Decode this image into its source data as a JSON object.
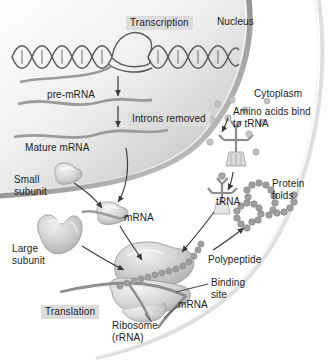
{
  "diagram": {
    "type": "biology-process-diagram",
    "background_color": "#ffffff",
    "ink_color": "#1c1c1c",
    "structure_fill": "#c9c9c9",
    "label_box_color": "#dcdcdc"
  },
  "labels": {
    "transcription": "Transcription",
    "nucleus": "Nucleus",
    "pre_mrna": "pre-mRNA",
    "introns_removed": "Introns removed",
    "mature_mrna": "Mature mRNA",
    "cytoplasm": "Cytoplasm",
    "amino_acids_bind": "Amino acids bind\nto tRNA",
    "small_subunit": "Small\nsubunit",
    "large_subunit": "Large\nsubunit",
    "mrna_middle": "mRNA",
    "trna": "tRNA",
    "protein_folds": "Protein\nfolds",
    "polypeptide": "Polypeptide",
    "binding_site": "Binding\nsite",
    "mrna_lower": "mRNA",
    "translation": "Translation",
    "ribosome": "Ribosome\n(rRNA)"
  },
  "structures": {
    "dna_helix": "double-helix",
    "transcription_bubble": "unwound-dna-loop",
    "nucleus_membrane": "gradient-arc",
    "cell_membrane": "faint-sweeping-curve",
    "mrna_strands": [
      "pre-mRNA wavy strand",
      "mature mRNA wavy strand"
    ],
    "ribosome_subunits": [
      "small subunit",
      "large subunit"
    ],
    "trna_molecule": "clover-cross with anticodon base",
    "amino_acids": "scattered gray circles",
    "polypeptide_chain": "beaded chain",
    "folded_protein": "beaded chain folded into loops"
  },
  "boxed_labels": [
    "Transcription",
    "Introns removed",
    "Translation"
  ]
}
